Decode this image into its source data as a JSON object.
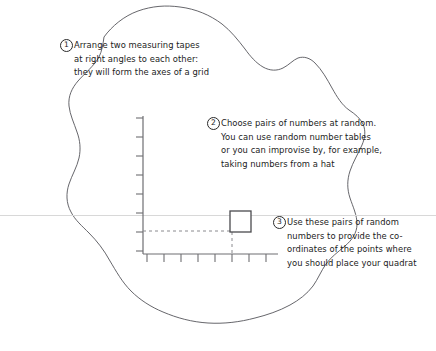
{
  "figure": {
    "background_color": "#ffffff",
    "width": 436,
    "height": 351
  },
  "callouts": [
    {
      "number": "1",
      "lines": [
        "Arrange two measuring tapes",
        "at right angles to each other:",
        "they will form the axes of a grid"
      ]
    },
    {
      "number": "2",
      "lines": [
        "Choose pairs of numbers at random.",
        "You can use random number tables",
        "or you can improvise by, for example,",
        "taking numbers from a hat"
      ]
    },
    {
      "number": "3",
      "lines": [
        "Use these pairs of random",
        "numbers to provide the co-",
        "ordinates of the points where",
        "you should place your quadrat"
      ]
    }
  ],
  "diagram": {
    "blob_outline_color": "#55555a",
    "axis_color": "#6e6e72",
    "dashed_color": "#8a8a8e",
    "quadrat_color": "#4a4a4e",
    "scanline_color": "#d8d8d8",
    "axes": {
      "origin_x": 143,
      "origin_y": 254,
      "y_axis_top": 116,
      "x_axis_right": 278,
      "y_tick_count": 8,
      "x_tick_count": 8,
      "y_tick_spacing": 19,
      "x_tick_spacing": 17
    },
    "quadrat": {
      "x": 230,
      "y": 211,
      "size": 21,
      "label": "quadrat-square"
    },
    "guides": {
      "horizontal_dashed_y": 231,
      "horizontal_dashed_from_x": 143,
      "horizontal_dashed_to_x": 232,
      "vertical_dashed_x": 232,
      "vertical_dashed_from_y": 232,
      "vertical_dashed_to_y": 254
    }
  }
}
